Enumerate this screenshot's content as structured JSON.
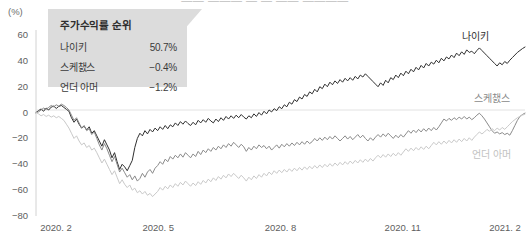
{
  "header": {
    "cropped_title": "—— ——— — — —— ————",
    "unit_label": "(%)"
  },
  "callout": {
    "title": "주가수익률 순위",
    "rows": [
      {
        "name": "나이키",
        "value": "50.7%"
      },
      {
        "name": "스케챐스",
        "value": "−0.4%"
      },
      {
        "name": "언더 아머",
        "value": "−1.2%"
      }
    ],
    "bg_color": "#dcdcdc"
  },
  "series_tags": [
    {
      "id": "nike",
      "label": "나이키",
      "color": "#2f2f2f",
      "x": 462,
      "y": 28
    },
    {
      "id": "skech",
      "label": "스케챐스",
      "color": "#8a8a8a",
      "x": 474,
      "y": 90
    },
    {
      "id": "ua",
      "label": "언더 아머",
      "color": "#c2c2c2",
      "x": 472,
      "y": 146
    }
  ],
  "chart_data": {
    "type": "line",
    "title": "",
    "xlabel": "",
    "ylabel": "(%)",
    "ylim": [
      -80,
      60
    ],
    "yticks": [
      60,
      40,
      20,
      0,
      -20,
      -40,
      -60,
      -80
    ],
    "xticks": [
      "2020. 2",
      "2020. 5",
      "2020. 8",
      "2020. 11",
      "2021. 2"
    ],
    "xtick_positions": [
      0,
      0.25,
      0.5,
      0.75,
      1.0
    ],
    "grid": false,
    "zero_line": true,
    "legend_position": "inline-right",
    "series": [
      {
        "name": "나이키",
        "color": "#2f2f2f",
        "final_value": 50.7,
        "values": [
          0.0,
          1.5,
          2.8,
          1.0,
          3.5,
          2.0,
          4.2,
          5.0,
          3.2,
          4.8,
          5.5,
          4.0,
          2.5,
          1.0,
          -4.0,
          -7.5,
          -5.0,
          -9.0,
          -12.0,
          -10.5,
          -13.5,
          -11.0,
          -16.0,
          -14.0,
          -18.0,
          -22.0,
          -26.0,
          -21.0,
          -25.0,
          -29.0,
          -35.0,
          -31.0,
          -38.0,
          -44.0,
          -40.0,
          -42.0,
          -45.0,
          -41.0,
          -37.0,
          -27.0,
          -20.0,
          -16.0,
          -18.0,
          -14.0,
          -16.5,
          -13.0,
          -15.0,
          -12.0,
          -14.0,
          -11.0,
          -13.0,
          -10.0,
          -12.5,
          -9.5,
          -11.0,
          -8.0,
          -10.0,
          -7.0,
          -9.0,
          -6.5,
          -8.5,
          -10.0,
          -7.5,
          -9.5,
          -6.0,
          -8.0,
          -5.5,
          -7.5,
          -4.5,
          -6.5,
          -8.0,
          -5.0,
          -7.0,
          -4.0,
          -6.0,
          -3.0,
          -5.0,
          -2.5,
          -4.5,
          -2.0,
          -4.0,
          -1.5,
          -3.5,
          -5.0,
          -2.5,
          -4.0,
          -1.0,
          -3.0,
          0.0,
          -2.0,
          1.0,
          -1.0,
          2.0,
          0.5,
          3.0,
          1.5,
          4.5,
          3.0,
          6.0,
          4.5,
          8.0,
          6.5,
          10.0,
          8.5,
          12.0,
          10.5,
          14.0,
          12.5,
          16.0,
          14.5,
          18.0,
          16.0,
          20.0,
          18.5,
          22.0,
          20.0,
          23.5,
          21.5,
          24.5,
          22.5,
          25.5,
          23.5,
          26.5,
          24.5,
          27.0,
          25.0,
          28.0,
          26.0,
          29.0,
          27.5,
          30.0,
          28.0,
          26.0,
          24.0,
          22.0,
          20.0,
          23.0,
          21.0,
          25.0,
          23.0,
          27.0,
          25.5,
          29.0,
          27.0,
          30.5,
          28.5,
          32.0,
          30.0,
          33.5,
          31.5,
          35.0,
          33.0,
          36.5,
          34.5,
          38.0,
          36.0,
          39.0,
          37.5,
          40.5,
          38.5,
          42.0,
          40.0,
          43.0,
          41.5,
          44.5,
          42.5,
          46.0,
          44.0,
          47.0,
          45.0,
          48.5,
          46.5,
          47.5,
          45.5,
          48.0,
          50.0,
          48.0,
          46.0,
          44.0,
          42.0,
          40.0,
          38.0,
          36.0,
          38.5,
          37.0,
          39.5,
          38.0,
          40.5,
          42.5,
          44.5,
          46.5,
          48.0,
          49.5,
          50.7
        ]
      },
      {
        "name": "스케챐스",
        "color": "#8a8a8a",
        "final_value": -0.4,
        "values": [
          0.0,
          0.5,
          2.0,
          3.5,
          2.5,
          4.0,
          5.5,
          4.5,
          6.0,
          5.0,
          6.5,
          5.5,
          4.0,
          2.0,
          -2.0,
          -6.0,
          -4.0,
          -8.0,
          -12.0,
          -10.0,
          -14.0,
          -12.5,
          -17.0,
          -15.0,
          -20.0,
          -25.0,
          -29.0,
          -24.0,
          -28.0,
          -33.0,
          -38.0,
          -34.0,
          -40.0,
          -46.0,
          -43.0,
          -46.5,
          -50.0,
          -48.0,
          -52.0,
          -49.0,
          -53.0,
          -51.0,
          -47.0,
          -50.0,
          -46.0,
          -44.0,
          -47.0,
          -43.0,
          -41.0,
          -38.0,
          -40.0,
          -36.0,
          -38.0,
          -34.0,
          -36.0,
          -33.0,
          -35.0,
          -32.0,
          -34.5,
          -31.0,
          -33.0,
          -35.0,
          -32.0,
          -34.0,
          -30.0,
          -32.5,
          -29.0,
          -31.0,
          -28.0,
          -30.0,
          -27.0,
          -29.0,
          -26.0,
          -28.0,
          -25.0,
          -27.0,
          -24.0,
          -26.0,
          -23.0,
          -25.0,
          -27.0,
          -24.5,
          -26.5,
          -30.0,
          -27.0,
          -29.0,
          -26.0,
          -28.0,
          -25.0,
          -27.0,
          -25.5,
          -28.0,
          -26.0,
          -29.0,
          -27.0,
          -25.0,
          -27.5,
          -24.5,
          -26.5,
          -24.0,
          -26.0,
          -23.5,
          -25.5,
          -23.0,
          -25.0,
          -22.5,
          -24.5,
          -22.0,
          -24.0,
          -22.5,
          -20.0,
          -22.0,
          -19.5,
          -21.5,
          -19.0,
          -21.0,
          -18.5,
          -20.5,
          -18.0,
          -20.0,
          -22.0,
          -20.0,
          -18.0,
          -20.5,
          -18.5,
          -21.0,
          -19.0,
          -17.0,
          -19.5,
          -17.5,
          -20.0,
          -22.0,
          -19.5,
          -21.5,
          -19.0,
          -17.0,
          -19.0,
          -16.5,
          -18.5,
          -16.0,
          -18.0,
          -20.0,
          -17.5,
          -19.5,
          -17.0,
          -19.0,
          -16.5,
          -14.0,
          -16.0,
          -13.5,
          -15.5,
          -13.0,
          -15.0,
          -12.5,
          -14.5,
          -12.0,
          -14.0,
          -11.5,
          -13.5,
          -11.0,
          -8.0,
          -5.0,
          -6.5,
          -4.5,
          -6.0,
          -4.0,
          -5.5,
          -3.5,
          -5.0,
          -3.0,
          -5.0,
          -3.5,
          -5.5,
          -4.0,
          -2.0,
          -0.5,
          -2.5,
          -5.0,
          -8.0,
          -11.0,
          -14.0,
          -16.0,
          -15.0,
          -16.5,
          -15.5,
          -17.0,
          -16.0,
          -17.5,
          -14.0,
          -10.0,
          -6.0,
          -3.0,
          -1.5,
          -0.4
        ]
      },
      {
        "name": "언더 아머",
        "color": "#c9c9c9",
        "final_value": -1.2,
        "values": [
          0.0,
          -1.0,
          -2.5,
          -1.5,
          -3.0,
          -2.0,
          -3.5,
          -2.5,
          -4.0,
          -3.0,
          -4.5,
          -6.0,
          -9.0,
          -12.0,
          -16.0,
          -20.0,
          -18.0,
          -22.0,
          -25.0,
          -23.5,
          -27.0,
          -25.5,
          -29.0,
          -27.5,
          -31.0,
          -35.0,
          -39.0,
          -36.0,
          -40.0,
          -44.0,
          -48.0,
          -45.0,
          -50.0,
          -55.0,
          -52.0,
          -55.5,
          -58.0,
          -56.0,
          -60.0,
          -58.5,
          -62.0,
          -60.5,
          -63.0,
          -61.0,
          -64.0,
          -62.5,
          -65.0,
          -63.0,
          -61.0,
          -58.0,
          -60.0,
          -57.0,
          -59.0,
          -56.0,
          -58.0,
          -55.0,
          -57.0,
          -54.0,
          -56.0,
          -53.0,
          -55.0,
          -57.0,
          -54.5,
          -56.5,
          -53.5,
          -55.5,
          -52.5,
          -54.5,
          -51.5,
          -53.5,
          -50.5,
          -52.5,
          -49.5,
          -51.5,
          -48.5,
          -50.5,
          -47.5,
          -49.5,
          -47.0,
          -49.0,
          -51.0,
          -48.5,
          -50.5,
          -53.0,
          -50.0,
          -52.0,
          -49.0,
          -51.0,
          -48.0,
          -50.0,
          -47.0,
          -49.0,
          -46.0,
          -48.0,
          -45.0,
          -47.0,
          -44.5,
          -46.5,
          -44.0,
          -46.0,
          -43.5,
          -45.5,
          -43.0,
          -45.0,
          -42.5,
          -44.5,
          -42.0,
          -44.0,
          -41.5,
          -43.5,
          -41.0,
          -43.0,
          -40.5,
          -42.5,
          -40.0,
          -42.0,
          -39.5,
          -41.5,
          -39.0,
          -41.0,
          -38.5,
          -40.5,
          -38.0,
          -40.0,
          -37.5,
          -39.5,
          -37.0,
          -39.0,
          -36.5,
          -38.5,
          -36.0,
          -38.0,
          -35.5,
          -37.5,
          -35.0,
          -33.0,
          -35.0,
          -32.5,
          -34.5,
          -32.0,
          -34.0,
          -31.5,
          -33.5,
          -31.0,
          -33.0,
          -30.5,
          -28.0,
          -30.0,
          -27.5,
          -29.5,
          -27.0,
          -29.0,
          -26.5,
          -28.5,
          -26.0,
          -28.0,
          -25.5,
          -23.0,
          -25.0,
          -22.5,
          -24.5,
          -22.0,
          -24.0,
          -21.5,
          -23.5,
          -21.0,
          -23.0,
          -20.5,
          -22.5,
          -20.0,
          -22.0,
          -19.5,
          -21.5,
          -19.0,
          -17.0,
          -15.0,
          -16.5,
          -15.0,
          -13.0,
          -14.5,
          -12.5,
          -14.0,
          -12.0,
          -13.5,
          -11.5,
          -13.0,
          -11.0,
          -9.0,
          -7.0,
          -5.5,
          -4.0,
          -3.0,
          -2.0,
          -1.2
        ]
      }
    ]
  }
}
